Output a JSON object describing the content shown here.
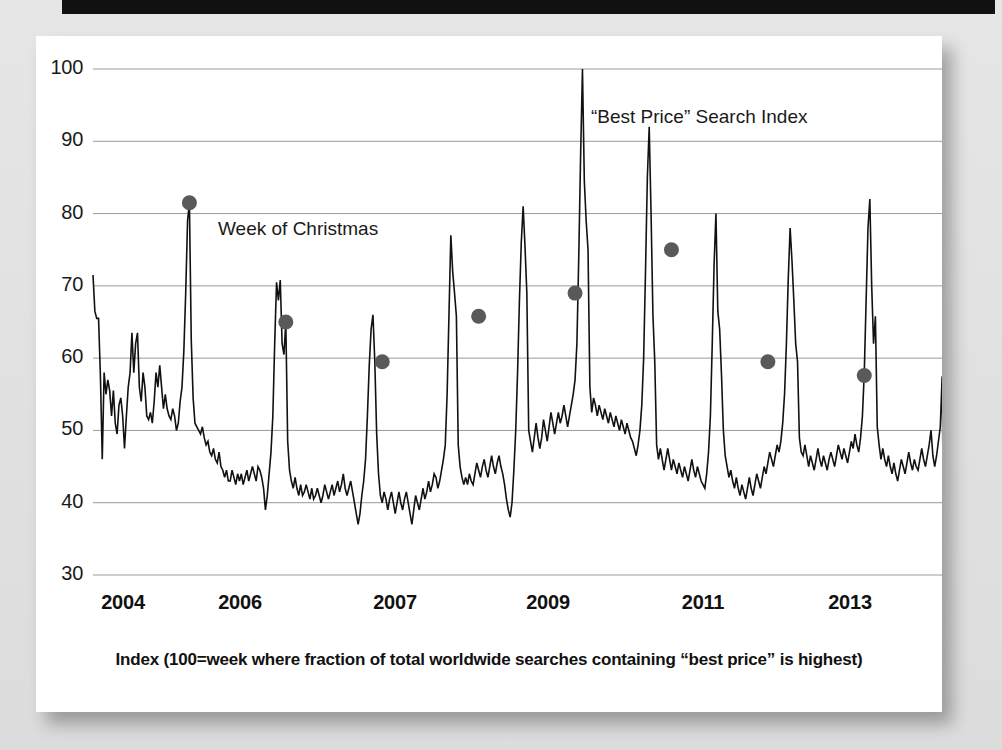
{
  "card": {
    "title": "“Best Price” Search Index",
    "annotation": "Week of Christmas",
    "caption": "Index (100=week where fraction of total worldwide searches containing “best price” is highest)"
  },
  "colors": {
    "line": "#111111",
    "marker": "#595959",
    "grid": "#9a9a9a",
    "axis_text": "#1a1a1a",
    "page_background": "#e4e4e4",
    "card_background": "#ffffff",
    "top_bar": "#111111"
  },
  "chart_data": {
    "type": "line",
    "title": "“Best Price” Search Index",
    "xlabel": "",
    "ylabel": "",
    "ylim": [
      30,
      100
    ],
    "yticks": [
      30,
      40,
      50,
      60,
      70,
      80,
      90,
      100
    ],
    "ytick_labels": [
      "30",
      "40",
      "50",
      "60",
      "70",
      "80",
      "90",
      "100"
    ],
    "xtick_labels": [
      "2004",
      "2006",
      "2007",
      "2009",
      "2011",
      "2013"
    ],
    "xtick_positions_px": [
      123,
      240,
      395,
      548,
      703,
      850
    ],
    "grid": true,
    "legend": "none",
    "annotations": [
      {
        "text": "Week of Christmas",
        "target_x_index": 52,
        "target_y": 81.5
      }
    ],
    "markers": {
      "label": "Week of Christmas",
      "shape": "circle",
      "color": "#595959",
      "points": [
        {
          "x_index": 52,
          "y": 81.5,
          "year": 2004
        },
        {
          "x_index": 104,
          "y": 65.0,
          "year": 2005
        },
        {
          "x_index": 156,
          "y": 59.5,
          "year": 2006
        },
        {
          "x_index": 208,
          "y": 65.8,
          "year": 2007
        },
        {
          "x_index": 260,
          "y": 69.0,
          "year": 2008
        },
        {
          "x_index": 312,
          "y": 75.0,
          "year": 2009
        },
        {
          "x_index": 364,
          "y": 59.5,
          "year": 2010
        },
        {
          "x_index": 416,
          "y": 57.6,
          "year": 2011
        },
        {
          "x_index": 468,
          "y": 59.5,
          "year": 2012
        },
        {
          "x_index": 520,
          "y": 65.8,
          "year": 2013
        }
      ]
    },
    "series": [
      {
        "name": "“Best Price” Search Index",
        "values": [
          71.5,
          66.5,
          65.5,
          65.5,
          57.5,
          46.0,
          58.0,
          55.0,
          57.0,
          55.5,
          52.0,
          55.5,
          51.0,
          49.5,
          53.5,
          54.5,
          52.0,
          47.5,
          52.0,
          56.0,
          58.0,
          63.5,
          58.0,
          62.0,
          63.5,
          56.0,
          54.0,
          58.0,
          56.0,
          52.0,
          51.5,
          52.5,
          51.0,
          54.0,
          58.0,
          56.0,
          59.0,
          56.0,
          53.0,
          55.0,
          53.0,
          52.0,
          51.5,
          53.0,
          52.0,
          50.0,
          51.0,
          54.0,
          56.0,
          61.0,
          69.0,
          79.0,
          81.5,
          62.5,
          54.5,
          51.0,
          50.5,
          50.0,
          49.5,
          50.5,
          49.0,
          48.0,
          48.5,
          47.0,
          46.5,
          47.5,
          46.0,
          45.5,
          47.0,
          45.0,
          44.5,
          43.5,
          44.5,
          43.0,
          43.0,
          44.5,
          43.5,
          42.5,
          44.0,
          43.0,
          44.0,
          42.5,
          43.5,
          44.5,
          43.0,
          44.0,
          45.0,
          44.0,
          43.0,
          45.0,
          44.5,
          43.5,
          42.0,
          39.0,
          41.0,
          44.0,
          47.0,
          52.0,
          62.0,
          70.5,
          68.0,
          70.8,
          62.0,
          60.5,
          65.0,
          48.5,
          44.5,
          43.0,
          42.0,
          43.5,
          42.0,
          41.0,
          42.5,
          41.0,
          41.5,
          42.5,
          41.5,
          40.5,
          42.0,
          40.5,
          41.0,
          42.0,
          41.0,
          40.0,
          41.0,
          42.5,
          41.5,
          40.5,
          41.5,
          42.5,
          41.0,
          42.0,
          43.0,
          41.5,
          42.5,
          44.0,
          42.0,
          41.0,
          42.0,
          43.0,
          41.5,
          40.0,
          38.5,
          37.0,
          38.5,
          41.0,
          43.0,
          46.0,
          52.0,
          59.0,
          64.0,
          66.0,
          59.5,
          49.5,
          44.0,
          41.0,
          40.0,
          41.5,
          40.5,
          39.0,
          40.5,
          41.5,
          40.0,
          38.5,
          40.0,
          41.5,
          40.0,
          39.0,
          40.5,
          41.5,
          40.0,
          38.5,
          37.0,
          39.0,
          41.0,
          40.0,
          39.0,
          40.5,
          42.0,
          40.5,
          41.5,
          43.0,
          41.5,
          42.5,
          44.0,
          43.5,
          42.0,
          43.0,
          44.5,
          46.0,
          48.0,
          55.0,
          66.0,
          77.0,
          72.0,
          69.0,
          65.8,
          48.0,
          45.0,
          43.5,
          42.5,
          43.5,
          42.5,
          44.0,
          43.0,
          42.5,
          44.0,
          45.5,
          44.5,
          43.5,
          45.0,
          46.0,
          44.5,
          43.5,
          45.0,
          46.5,
          45.0,
          44.0,
          45.5,
          46.5,
          45.0,
          44.0,
          42.5,
          40.5,
          39.0,
          38.0,
          40.0,
          44.5,
          50.0,
          58.0,
          68.0,
          76.0,
          81.0,
          75.5,
          69.0,
          50.0,
          48.5,
          47.0,
          49.0,
          51.0,
          49.0,
          47.5,
          49.0,
          51.5,
          50.0,
          48.5,
          50.5,
          52.5,
          51.0,
          49.5,
          51.0,
          52.5,
          51.0,
          52.0,
          53.5,
          52.0,
          50.5,
          52.0,
          53.5,
          55.0,
          57.0,
          62.0,
          74.0,
          88.0,
          100.0,
          84.5,
          79.0,
          75.0,
          56.0,
          52.5,
          54.5,
          53.5,
          52.0,
          53.5,
          52.5,
          51.5,
          53.0,
          52.0,
          51.0,
          52.5,
          51.5,
          50.5,
          52.0,
          51.0,
          50.0,
          51.5,
          50.5,
          49.5,
          51.0,
          50.0,
          49.0,
          48.5,
          47.5,
          46.5,
          48.0,
          50.0,
          53.5,
          60.0,
          72.0,
          85.0,
          92.0,
          80.0,
          66.0,
          59.5,
          48.0,
          46.0,
          47.5,
          46.0,
          44.5,
          46.0,
          47.5,
          46.0,
          44.5,
          46.0,
          45.0,
          44.0,
          45.5,
          44.5,
          43.5,
          45.0,
          44.0,
          43.0,
          44.5,
          46.0,
          44.5,
          43.5,
          45.0,
          44.0,
          43.0,
          42.5,
          42.0,
          44.0,
          47.0,
          52.0,
          62.0,
          73.0,
          80.0,
          66.5,
          64.0,
          57.6,
          50.0,
          46.5,
          45.0,
          43.5,
          44.5,
          43.0,
          42.0,
          43.5,
          42.0,
          41.0,
          42.5,
          41.5,
          40.5,
          42.0,
          43.5,
          42.0,
          41.0,
          42.5,
          44.0,
          43.0,
          42.0,
          43.5,
          45.0,
          44.0,
          45.5,
          47.0,
          46.0,
          45.0,
          46.5,
          48.0,
          47.0,
          48.5,
          51.0,
          55.0,
          62.0,
          71.0,
          78.0,
          73.5,
          68.0,
          62.0,
          59.5,
          49.0,
          47.0,
          46.5,
          48.0,
          46.5,
          45.0,
          46.5,
          45.5,
          44.5,
          46.0,
          47.5,
          46.0,
          45.0,
          46.5,
          45.5,
          44.5,
          46.0,
          47.0,
          46.0,
          45.0,
          46.5,
          48.0,
          47.0,
          46.0,
          47.5,
          46.5,
          45.5,
          47.0,
          48.5,
          47.5,
          49.5,
          48.0,
          47.0,
          49.0,
          52.0,
          58.0,
          68.0,
          78.0,
          82.0,
          70.0,
          62.0,
          65.8,
          50.5,
          48.0,
          46.0,
          47.5,
          46.0,
          45.0,
          46.5,
          45.0,
          44.0,
          45.5,
          44.0,
          43.0,
          44.5,
          46.0,
          45.0,
          44.0,
          45.5,
          47.0,
          45.5,
          44.5,
          46.0,
          45.0,
          44.5,
          46.0,
          47.5,
          46.0,
          45.0,
          46.5,
          48.0,
          50.0,
          46.5,
          45.0,
          46.5,
          48.5,
          50.5,
          57.5,
          30.0
        ]
      }
    ]
  }
}
